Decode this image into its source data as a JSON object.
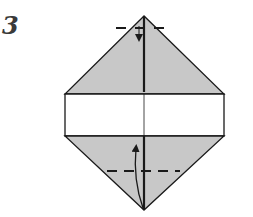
{
  "diagram": {
    "step_number": "3",
    "colors": {
      "paper_colored": "#c8c8c8",
      "paper_white": "#ffffff",
      "line": "#1a1a1a"
    },
    "symbols": [
      {
        "type": "valley-fold-line",
        "location": "top tip"
      },
      {
        "type": "fold-arrow",
        "direction": "down",
        "location": "top tip"
      },
      {
        "type": "valley-fold-line",
        "location": "lower half"
      },
      {
        "type": "fold-arrow",
        "direction": "up",
        "location": "bottom tip to lower center"
      }
    ]
  }
}
